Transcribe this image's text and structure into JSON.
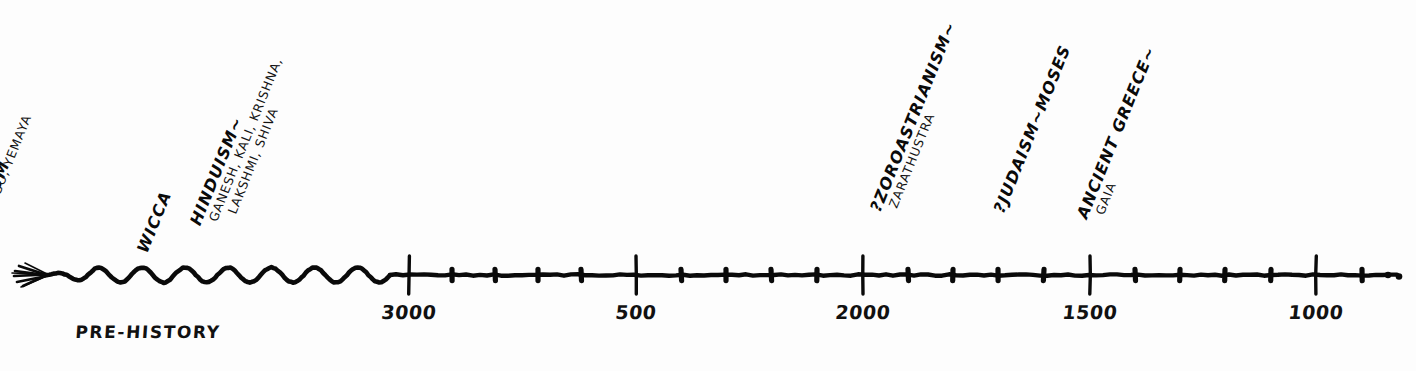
{
  "chart_data": {
    "type": "timeline",
    "title": "",
    "orientation": "horizontal",
    "axis": {
      "label": "Years Before Present (BCE / years ago)",
      "direction": "decreasing-left-to-right",
      "start_pixel": 409,
      "end_pixel": 1400,
      "major_ticks": [
        {
          "label": "3000",
          "value": 3000,
          "x": 409
        },
        {
          "label": "500",
          "value": 2500,
          "x": 636
        },
        {
          "label": "2000",
          "value": 2000,
          "x": 863
        },
        {
          "label": "1500",
          "value": 1500,
          "x": 1090
        },
        {
          "label": "1000",
          "value": 1000,
          "x": 1316
        }
      ],
      "minor_tick_xs": [
        452,
        495,
        538,
        581,
        681,
        726,
        771,
        817,
        908,
        953,
        998,
        1044,
        1135,
        1180,
        1225,
        1271,
        1362
      ],
      "left_end": "arrowhead",
      "right_end": "ellipsis",
      "prehistory_style": "wavy",
      "wave_start_x": 45,
      "wave_end_x": 390,
      "baseline_y": 275
    },
    "eras": [
      {
        "name": "PRE-HISTORY",
        "center_x": 148,
        "label_y": 322
      }
    ],
    "events": [
      {
        "id": "animism",
        "title": "ANIMISM",
        "sub": [],
        "anchor_x": 62,
        "rotation_deg": -68
      },
      {
        "id": "vodun",
        "title": "VODUN~",
        "sub": [
          "CHANGO, YEMAYA"
        ],
        "anchor_x": 112,
        "rotation_deg": -68
      },
      {
        "id": "wicca",
        "title": "WICCA",
        "sub": [],
        "anchor_x": 212,
        "rotation_deg": -68
      },
      {
        "id": "hinduism",
        "title": "HINDUISM~",
        "sub": [
          "GANESH, KALI, KRISHNA,",
          "LAKSHMI, SHIVA"
        ],
        "anchor_x": 406,
        "rotation_deg": -68
      },
      {
        "id": "zoroastrianism",
        "title": "?ZOROASTRIANISM~",
        "sub": [
          "ZARATHUSTRA"
        ],
        "anchor_x": 1083,
        "rotation_deg": -68
      },
      {
        "id": "judaism",
        "title": "?JUDAISM~MOSES",
        "sub": [],
        "anchor_x": 1167,
        "rotation_deg": -68
      },
      {
        "id": "ancient_greece",
        "title": "ANCIENT GREECE~",
        "sub": [
          "GAIA"
        ],
        "anchor_x": 1273,
        "rotation_deg": -68
      }
    ],
    "colors": {
      "ink": "#0a0a0a",
      "background": "#fdfdfd"
    }
  }
}
